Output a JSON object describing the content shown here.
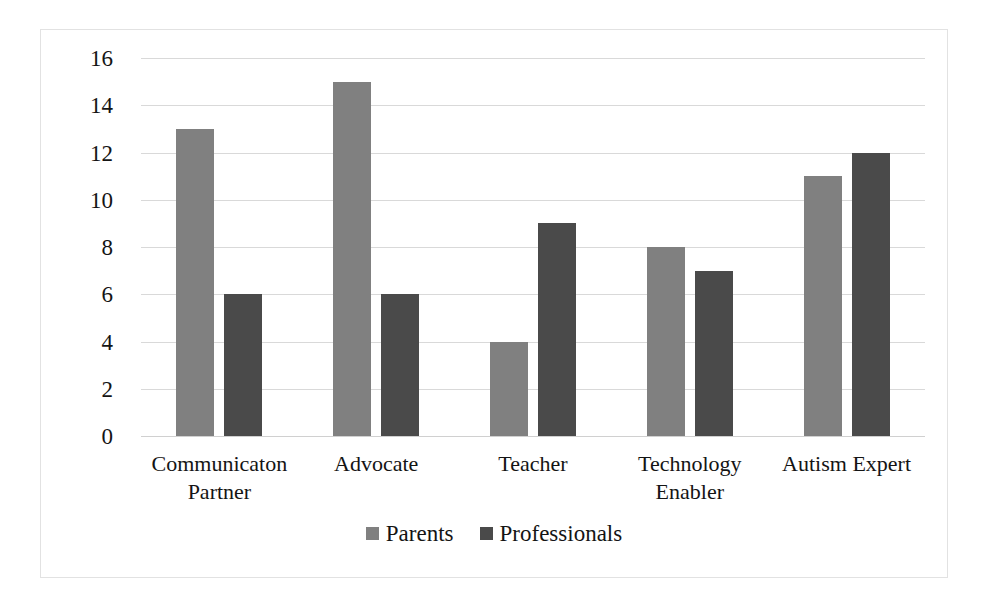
{
  "chart_data": {
    "type": "bar",
    "title": "",
    "subtitle": "",
    "xlabel": "",
    "ylabel": "",
    "ylim": [
      0,
      16
    ],
    "ytick_step": 2,
    "yticks": [
      16,
      14,
      12,
      10,
      8,
      6,
      4,
      2,
      0
    ],
    "grid": true,
    "legend_position": "bottom-center",
    "categories": [
      "Communicaton Partner",
      "Advocate",
      "Teacher",
      "Technology Enabler",
      "Autism Expert"
    ],
    "category_lines": [
      [
        "Communicaton",
        "Partner"
      ],
      [
        "Advocate"
      ],
      [
        "Teacher"
      ],
      [
        "Technology",
        "Enabler"
      ],
      [
        "Autism Expert"
      ]
    ],
    "series": [
      {
        "name": "Parents",
        "color": "#808080",
        "values": [
          13,
          15,
          4,
          8,
          11
        ]
      },
      {
        "name": "Professionals",
        "color": "#4a4a4a",
        "values": [
          6,
          6,
          9,
          7,
          12
        ]
      }
    ]
  },
  "style": {
    "background": "#ffffff",
    "border_color": "#e2e2e2",
    "gridline_color": "#d9d9d9",
    "text_color": "#141414"
  }
}
